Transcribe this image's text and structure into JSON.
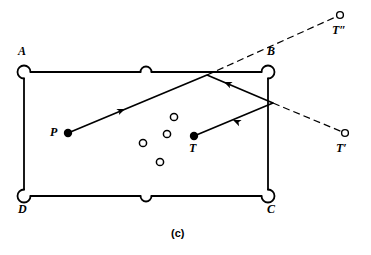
{
  "figure": {
    "caption": "(c)",
    "caption_pos": {
      "x": 178,
      "y": 232
    },
    "background_color": "#ffffff",
    "stroke_color": "#000000"
  },
  "table": {
    "name": "billiard-table",
    "rail_stroke_width": 1.8,
    "inner_rect": {
      "left": 24,
      "top": 72,
      "right": 268,
      "bottom": 196
    },
    "pocket_radius_corner": 6.5,
    "pocket_radius_side": 5.5,
    "corners": [
      {
        "id": "A",
        "label": "A",
        "x": 24,
        "y": 72,
        "label_x": 18,
        "label_y": 48
      },
      {
        "id": "B",
        "label": "B",
        "x": 268,
        "y": 72,
        "label_x": 268,
        "label_y": 48
      },
      {
        "id": "C",
        "label": "C",
        "x": 268,
        "y": 196,
        "label_x": 268,
        "label_y": 207
      },
      {
        "id": "D",
        "label": "D",
        "x": 24,
        "y": 196,
        "label_x": 18,
        "label_y": 207
      }
    ],
    "side_pockets": [
      {
        "id": "top-middle",
        "x": 146,
        "y": 72
      },
      {
        "id": "bottom-middle",
        "x": 146,
        "y": 196
      }
    ]
  },
  "balls": {
    "cue": {
      "id": "P",
      "label": "P",
      "type": "solid",
      "x": 68,
      "y": 133,
      "r": 4.2,
      "label_x": 51,
      "label_y": 128
    },
    "target": {
      "id": "T",
      "label": "T",
      "type": "solid",
      "x": 194,
      "y": 136,
      "r": 4.2,
      "label_x": 190,
      "label_y": 146
    },
    "obstacles": [
      {
        "id": "obstacle-1",
        "x": 174,
        "y": 117,
        "r": 3.6
      },
      {
        "id": "obstacle-2",
        "x": 167,
        "y": 134,
        "r": 3.6
      },
      {
        "id": "obstacle-3",
        "x": 143,
        "y": 143,
        "r": 3.6
      },
      {
        "id": "obstacle-4",
        "x": 160,
        "y": 162,
        "r": 3.6
      }
    ],
    "virtual_images": [
      {
        "id": "T-double-prime",
        "label": "T″",
        "x": 340,
        "y": 15,
        "r": 3.4,
        "label_x": 334,
        "label_y": 28
      },
      {
        "id": "T-prime",
        "label": "T′",
        "x": 345,
        "y": 133,
        "r": 3.4,
        "label_x": 338,
        "label_y": 146
      }
    ]
  },
  "paths": {
    "shot": {
      "name": "shot-path",
      "stroke_width": 1.7,
      "points": [
        {
          "x": 68,
          "y": 133
        },
        {
          "x": 207,
          "y": 75
        },
        {
          "x": 273,
          "y": 103
        },
        {
          "x": 194,
          "y": 136
        }
      ],
      "arrows": [
        {
          "x": 125,
          "y": 109,
          "angle": -22.6
        },
        {
          "x": 224,
          "y": 82,
          "angle": 23.0
        },
        {
          "x": 233,
          "y": 120,
          "angle": 202.6
        }
      ]
    },
    "construction_lines": [
      {
        "id": "aim-line-to-T-double-prime",
        "from": {
          "x": 207,
          "y": 75
        },
        "to": {
          "x": 340,
          "y": 15
        },
        "style": "dashed",
        "dash": "7,4",
        "stroke_width": 1.2
      },
      {
        "id": "reflection-line-to-T-prime",
        "from": {
          "x": 273,
          "y": 103
        },
        "to": {
          "x": 345,
          "y": 133
        },
        "style": "dashed",
        "dash": "7,4",
        "stroke_width": 1.2
      }
    ]
  }
}
